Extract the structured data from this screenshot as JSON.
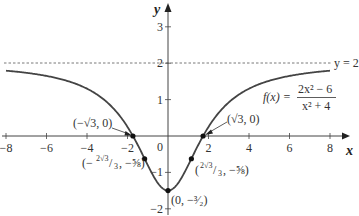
{
  "chart_data": {
    "type": "line",
    "title": "",
    "function_label": "f(x) = (2x^2 - 6)/(x^2 + 4)",
    "function_label_parts": {
      "lhs": "f(x) =",
      "numerator": "2x² − 6",
      "denominator": "x² + 4"
    },
    "xlabel": "x",
    "ylabel": "y",
    "xlim": [
      -8,
      8
    ],
    "ylim": [
      -2,
      3
    ],
    "x_ticks": [
      -8,
      -6,
      -4,
      -2,
      2,
      4,
      6,
      8
    ],
    "x_tick_labels": [
      "−8",
      "−6",
      "−4",
      "−2",
      "2",
      "4",
      "6",
      "8"
    ],
    "y_ticks": [
      -2,
      -1,
      1,
      2,
      3
    ],
    "y_tick_labels": [
      "−2",
      "−1",
      "1",
      "2",
      "3"
    ],
    "origin_label": "0",
    "grid": false,
    "asymptote": {
      "y": 2,
      "label": "y = 2",
      "style": "dashed"
    },
    "series": [
      {
        "name": "f(x)",
        "x": [
          -8,
          -7,
          -6,
          -5,
          -4,
          -3,
          -2,
          -1.732,
          -1.155,
          -1,
          0,
          1,
          1.155,
          1.732,
          2,
          3,
          4,
          5,
          6,
          7,
          8
        ],
        "values": [
          1.794,
          1.736,
          1.65,
          1.517,
          1.3,
          0.923,
          0.25,
          0,
          -0.625,
          -0.8,
          -1.5,
          -0.8,
          -0.625,
          0,
          0.25,
          0.923,
          1.3,
          1.517,
          1.65,
          1.736,
          1.794
        ]
      }
    ],
    "marked_points": [
      {
        "x": -1.732,
        "y": 0,
        "label": "(−√3, 0)"
      },
      {
        "x": 1.732,
        "y": 0,
        "label": "(√3, 0)"
      },
      {
        "x": -1.155,
        "y": -0.625,
        "label": "(−2√3/3, −5/8)"
      },
      {
        "x": 1.155,
        "y": -0.625,
        "label": "(2√3/3, −5/8)"
      },
      {
        "x": 0,
        "y": -1.5,
        "label": "(0, −3/2)"
      }
    ]
  },
  "labels": {
    "neg_sqrt3": "(−√3, 0)",
    "pos_sqrt3": "(√3, 0)",
    "neg_inflection_open": "(−",
    "neg_inflection_frac": "2√3",
    "neg_inflection_den": "3",
    "neg_inflection_rest": ", −⅝)",
    "pos_inflection_open": "(",
    "pos_inflection_frac": "2√3",
    "pos_inflection_den": "3",
    "pos_inflection_rest": ", −⅝)",
    "min_point": "(0, −³⁄₂)"
  }
}
